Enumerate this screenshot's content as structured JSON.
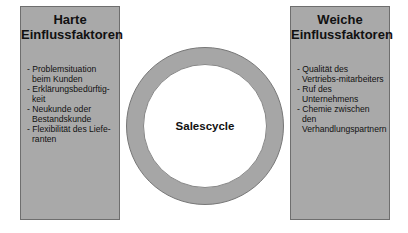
{
  "left_box": {
    "title_line1": "Harte",
    "title_line2": "Einflussfaktoren",
    "items": [
      "- Problemsituation beim Kunden",
      "- Erklärungsbedürftig-keit",
      "- Neukunde oder Bestandskunde",
      "- Flexibilität des Liefe-ranten"
    ]
  },
  "center": {
    "label": "Salescycle"
  },
  "right_box": {
    "title_line1": "Weiche",
    "title_line2": "Einflussfaktoren",
    "items": [
      "- Qualität des Vertriebs-mitarbeiters",
      "- Ruf des Unternehmens",
      "- Chemie zwischen den Verhandlungspartnern"
    ]
  },
  "colors": {
    "box_fill": "#a9a9a9",
    "ring_fill": "#a6a6a6",
    "background": "#ffffff"
  }
}
